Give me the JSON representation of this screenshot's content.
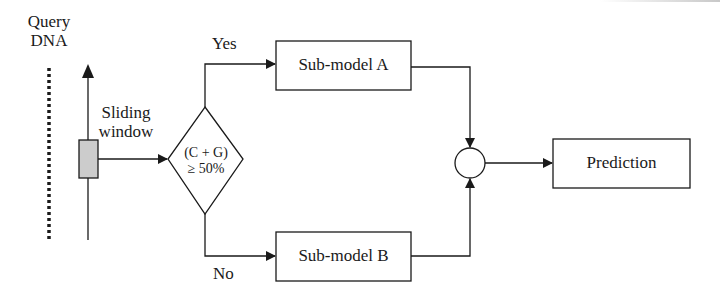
{
  "diagram": {
    "input_label": [
      "Query",
      "DNA"
    ],
    "window_label": [
      "Sliding",
      "window"
    ],
    "decision": {
      "line1": "(C + G)",
      "line2": "≥ 50%"
    },
    "branch_yes": "Yes",
    "branch_no": "No",
    "submodel_a": "Sub-model A",
    "submodel_b": "Sub-model B",
    "output": "Prediction",
    "colors": {
      "stroke": "#1a1a1a",
      "window_fill": "#cccccc",
      "background": "#ffffff"
    }
  }
}
